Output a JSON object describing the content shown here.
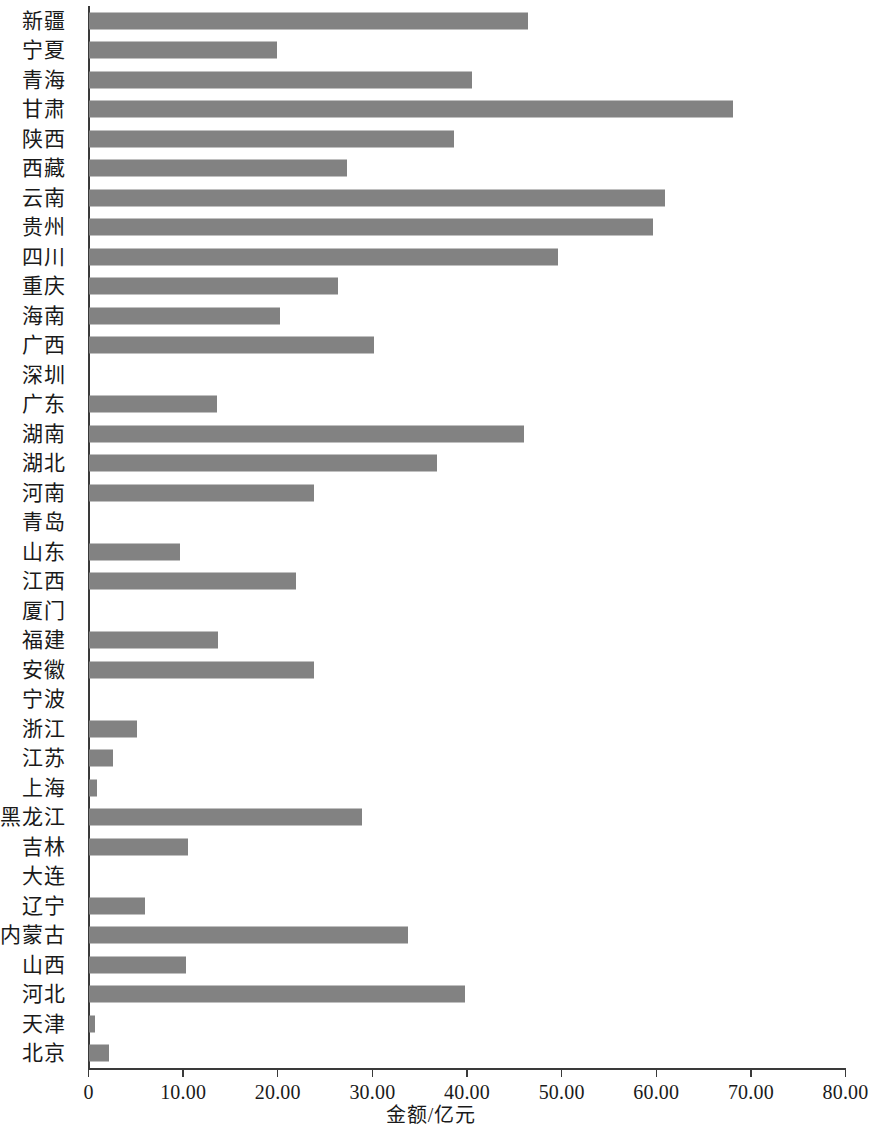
{
  "chart": {
    "type": "bar",
    "orientation": "horizontal",
    "bar_color": "#828282",
    "axis_color": "#3a3a3a"
  },
  "chart_data": {
    "type": "bar",
    "title": "",
    "subtitle": "",
    "xlabel": "金额/亿元",
    "ylabel": "",
    "orientation": "horizontal",
    "grid": false,
    "legend": false,
    "xlim": [
      0,
      80
    ],
    "xticks": [
      0,
      10,
      20,
      30,
      40,
      50,
      60,
      70,
      80
    ],
    "xtick_labels": [
      "0",
      "10.00",
      "20.00",
      "30.00",
      "40.00",
      "50.00",
      "60.00",
      "70.00",
      "80.00"
    ],
    "categories": [
      "新疆",
      "宁夏",
      "青海",
      "甘肃",
      "陕西",
      "西藏",
      "云南",
      "贵州",
      "四川",
      "重庆",
      "海南",
      "广西",
      "深圳",
      "广东",
      "湖南",
      "湖北",
      "河南",
      "青岛",
      "山东",
      "江西",
      "厦门",
      "福建",
      "安徽",
      "宁波",
      "浙江",
      "江苏",
      "上海",
      "黑龙江",
      "吉林",
      "大连",
      "辽宁",
      "内蒙古",
      "山西",
      "河北",
      "天津",
      "北京"
    ],
    "values": [
      46.4,
      19.9,
      40.5,
      68.1,
      38.6,
      27.3,
      60.9,
      59.6,
      49.6,
      26.3,
      20.2,
      30.1,
      0.0,
      13.5,
      46.0,
      36.8,
      23.8,
      0.0,
      9.6,
      21.9,
      0.0,
      13.6,
      23.8,
      0.0,
      5.1,
      2.5,
      0.8,
      28.8,
      10.5,
      0.0,
      5.9,
      33.7,
      10.3,
      39.7,
      0.65,
      2.1
    ]
  }
}
